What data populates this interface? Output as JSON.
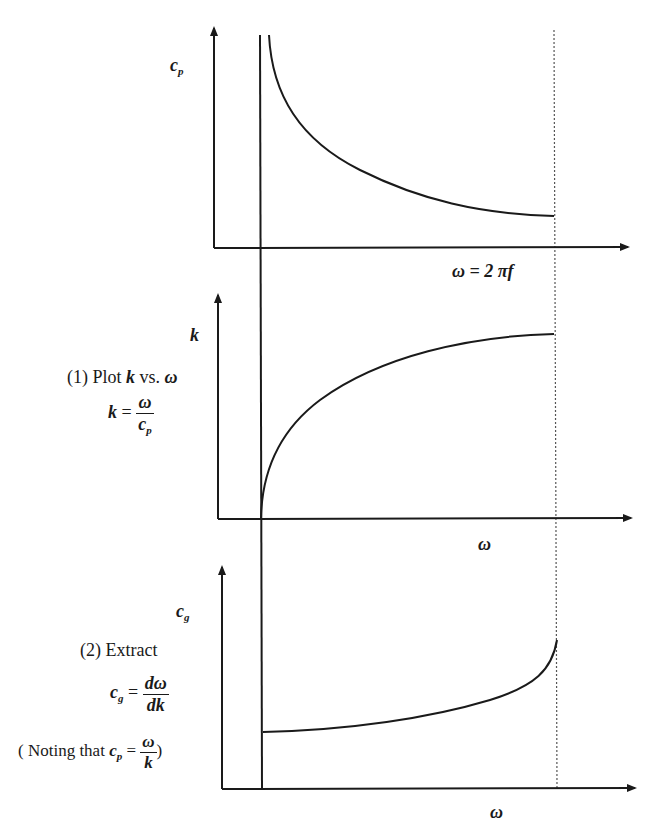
{
  "panels": [
    {
      "id": "phase-velocity",
      "y_label": "c",
      "y_label_sub": "p",
      "x_label": "ω = 2 πf",
      "curve": "decreasing hyperbola from cutoff, flattening toward dotted limit"
    },
    {
      "id": "wavenumber",
      "y_label": "k",
      "x_label": "ω",
      "annotation_title": "(1) Plot k vs. ω",
      "annotation_title_parts": {
        "prefix": "(1) Plot ",
        "k": "k",
        "mid": " vs. ",
        "omega": "ω"
      },
      "formula": {
        "lhs": "k",
        "eq": "=",
        "num": "ω",
        "den_base": "c",
        "den_sub": "p"
      },
      "curve": "increasing concave curve starting at cutoff frequency"
    },
    {
      "id": "group-velocity",
      "y_label": "c",
      "y_label_sub": "g",
      "x_label": "ω",
      "annotation_title": "(2) Extract",
      "formula": {
        "lhs_base": "c",
        "lhs_sub": "g",
        "eq": "=",
        "num": "dω",
        "den": "dk"
      },
      "note": {
        "prefix": "( Noting that ",
        "lhs_base": "c",
        "lhs_sub": "p",
        "eq": "=",
        "num": "ω",
        "den": "k",
        "suffix": ")"
      },
      "curve": "slowly increasing, rising steeply near dotted limit"
    }
  ],
  "colors": {
    "line": "#1a1a1a",
    "background": "#ffffff",
    "dotted": "#555555"
  }
}
